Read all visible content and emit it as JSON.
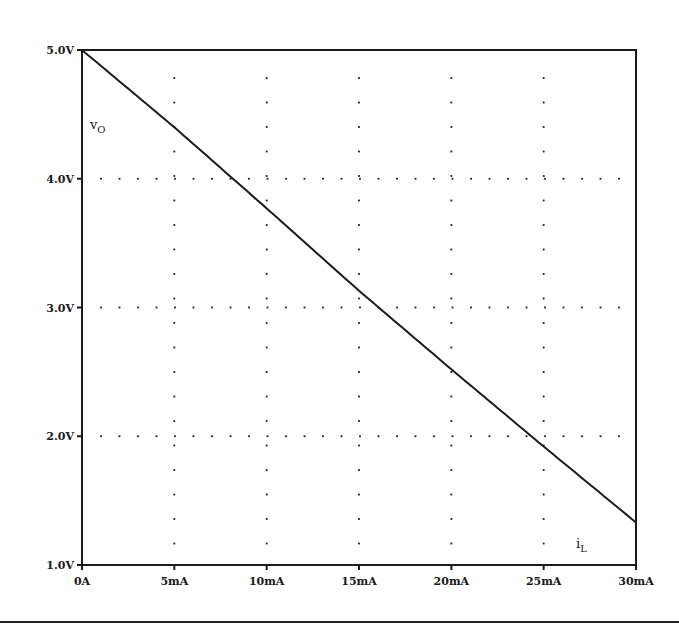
{
  "chart_data": {
    "type": "line",
    "title": "",
    "xlabel": "i_L",
    "ylabel": "v_O",
    "x_tick_labels": [
      "0A",
      "5mA",
      "10mA",
      "15mA",
      "20mA",
      "25mA",
      "30mA"
    ],
    "y_tick_labels": [
      "1.0V",
      "2.0V",
      "3.0V",
      "4.0V",
      "5.0V"
    ],
    "x_ticks_mA": [
      0,
      5,
      10,
      15,
      20,
      25,
      30
    ],
    "y_ticks_V": [
      1.0,
      2.0,
      3.0,
      4.0,
      5.0
    ],
    "xlim": [
      0,
      30
    ],
    "ylim": [
      1.0,
      5.0
    ],
    "grid": "dotted",
    "legend": "none",
    "series": [
      {
        "name": "v_O",
        "x": [
          0,
          5,
          10,
          15,
          20,
          25,
          30
        ],
        "values": [
          5.0,
          4.4,
          3.77,
          3.13,
          2.52,
          1.92,
          1.33
        ]
      }
    ]
  },
  "labels": {
    "y_var_main": "v",
    "y_var_sub": "O",
    "x_var_main": "i",
    "x_var_sub": "L"
  },
  "colors": {
    "ink": "#1a1a1a",
    "background": "#ffffff"
  }
}
